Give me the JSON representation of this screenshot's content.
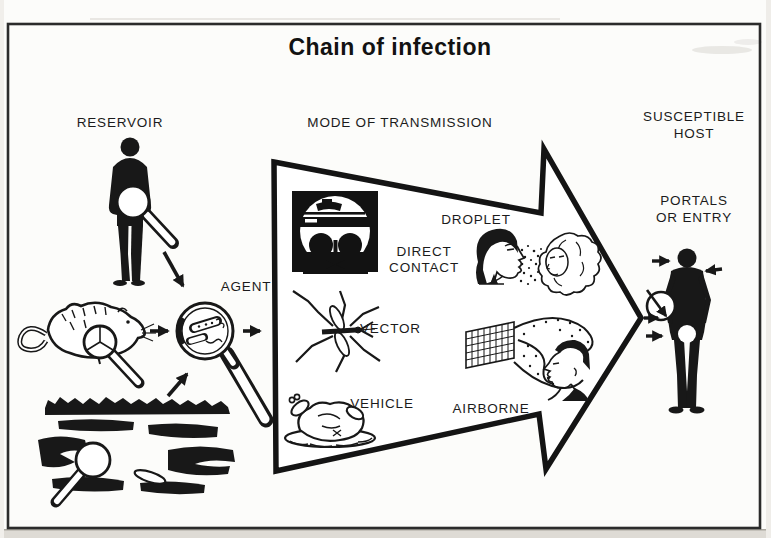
{
  "diagram": {
    "title": "Chain of infection",
    "labels": {
      "reservoir": "RESERVOIR",
      "mode_of_transmission": "MODE OF TRANSMISSION",
      "susceptible_host": "SUSCEPTIBLE\nHOST",
      "portals_or_entry": "PORTALS\nOR ENTRY",
      "agent": "AGENT",
      "direct_contact": "DIRECT\nCONTACT",
      "droplet": "DROPLET",
      "vector": "VECTOR",
      "vehicle": "VEHICLE",
      "airborne": "AIRBORNE"
    },
    "colors": {
      "ink": "#181818",
      "paper": "#fcfcfa",
      "page_edge": "#dedbd5"
    }
  }
}
